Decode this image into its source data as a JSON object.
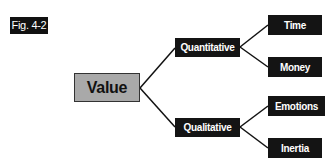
{
  "figure_label": "Fig. 4-2",
  "diagram": {
    "type": "tree",
    "root": {
      "label": "Value",
      "fill": "#a9a9a9"
    },
    "level1": [
      {
        "label": "Quantitative",
        "children": [
          {
            "label": "Time"
          },
          {
            "label": "Money"
          }
        ]
      },
      {
        "label": "Qualitative",
        "children": [
          {
            "label": "Emotions"
          },
          {
            "label": "Inertia"
          }
        ]
      }
    ],
    "node_fill": "#141414",
    "edge_color": "#111111"
  }
}
